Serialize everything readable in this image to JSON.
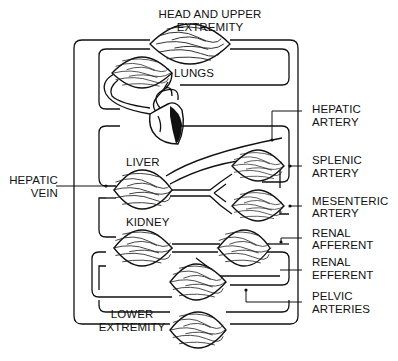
{
  "diagram": {
    "type": "circulatory-system-schematic",
    "organs": [
      {
        "id": "head",
        "label_lines": [
          "HEAD AND UPPER",
          "EXTREMITY"
        ]
      },
      {
        "id": "lungs",
        "label_lines": [
          "LUNGS"
        ]
      },
      {
        "id": "liver",
        "label_lines": [
          "LIVER"
        ]
      },
      {
        "id": "kidney",
        "label_lines": [
          "KIDNEY"
        ]
      },
      {
        "id": "lower",
        "label_lines": [
          "LOWER",
          "EXTREMITY"
        ]
      }
    ],
    "callouts": [
      {
        "id": "hepatic-vein",
        "label_lines": [
          "HEPATIC",
          "VEIN"
        ]
      },
      {
        "id": "hepatic-artery",
        "label_lines": [
          "HEPATIC",
          "ARTERY"
        ]
      },
      {
        "id": "splenic-artery",
        "label_lines": [
          "SPLENIC",
          "ARTERY"
        ]
      },
      {
        "id": "mesenteric-artery",
        "label_lines": [
          "MESENTERIC",
          "ARTERY"
        ]
      },
      {
        "id": "renal-afferent",
        "label_lines": [
          "RENAL",
          "AFFERENT"
        ]
      },
      {
        "id": "renal-efferent",
        "label_lines": [
          "RENAL",
          "EFFERENT"
        ]
      },
      {
        "id": "pelvic-arteries",
        "label_lines": [
          "PELVIC",
          "ARTERIES"
        ]
      }
    ],
    "colors": {
      "line": "#111111",
      "background": "#ffffff"
    }
  }
}
